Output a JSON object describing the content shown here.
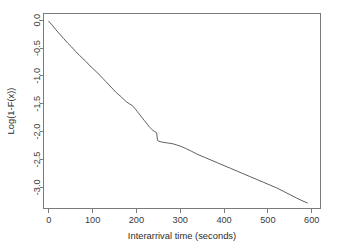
{
  "chart_data": {
    "type": "line",
    "title": "",
    "subtitle": "",
    "xlabel": "Interarrival time (seconds)",
    "ylabel": "Log(1-F(x))",
    "xlim": [
      -12,
      620
    ],
    "ylim": [
      -3.38,
      0.12
    ],
    "xticks": [
      0,
      100,
      200,
      300,
      400,
      500,
      600
    ],
    "xticklabels": [
      "0",
      "100",
      "200",
      "300",
      "400",
      "500",
      "600"
    ],
    "yticks": [
      0.0,
      -0.5,
      -1.0,
      -1.5,
      -2.0,
      -2.5,
      -3.0
    ],
    "yticklabels": [
      "0.0",
      "-0.5",
      "-1.0",
      "-1.5",
      "-2.0",
      "-2.5",
      "-3.0"
    ],
    "grid": false,
    "legend": null,
    "legend_position": "none",
    "box": true,
    "annotations": [],
    "series": [
      {
        "name": "empirical log survival",
        "color": "#555555",
        "x": [
          0,
          8,
          16,
          25,
          34,
          43,
          52,
          61,
          70,
          78,
          86,
          94,
          100,
          106,
          112,
          118,
          124,
          130,
          136,
          142,
          148,
          154,
          160,
          166,
          172,
          178,
          184,
          190,
          194,
          198,
          202,
          206,
          210,
          214,
          218,
          222,
          226,
          230,
          234,
          238,
          242,
          246,
          248,
          250,
          254,
          260,
          268,
          276,
          284,
          292,
          300,
          312,
          325,
          340,
          355,
          370,
          385,
          400,
          415,
          430,
          445,
          460,
          475,
          490,
          505,
          520,
          535,
          550,
          565,
          578,
          590
        ],
        "y": [
          -0.02,
          -0.09,
          -0.17,
          -0.25,
          -0.33,
          -0.41,
          -0.48,
          -0.56,
          -0.63,
          -0.69,
          -0.75,
          -0.82,
          -0.86,
          -0.91,
          -0.95,
          -1.0,
          -1.05,
          -1.1,
          -1.15,
          -1.2,
          -1.25,
          -1.3,
          -1.34,
          -1.38,
          -1.43,
          -1.47,
          -1.5,
          -1.53,
          -1.56,
          -1.6,
          -1.64,
          -1.68,
          -1.72,
          -1.76,
          -1.8,
          -1.84,
          -1.88,
          -1.92,
          -1.95,
          -1.98,
          -2.0,
          -2.02,
          -2.15,
          -2.17,
          -2.18,
          -2.19,
          -2.2,
          -2.21,
          -2.22,
          -2.24,
          -2.26,
          -2.3,
          -2.35,
          -2.41,
          -2.46,
          -2.51,
          -2.56,
          -2.61,
          -2.66,
          -2.71,
          -2.76,
          -2.81,
          -2.86,
          -2.91,
          -2.96,
          -3.01,
          -3.07,
          -3.13,
          -3.19,
          -3.24,
          -3.28
        ]
      }
    ]
  }
}
